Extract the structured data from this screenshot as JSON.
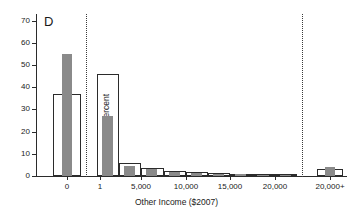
{
  "chart_data": {
    "type": "bar",
    "title": "",
    "panel_label": "D",
    "xlabel": "Other Income ($2007)",
    "ylabel": "Percent",
    "ylim": [
      0,
      73
    ],
    "yticks": [
      0,
      10,
      20,
      30,
      40,
      50,
      60,
      70
    ],
    "ytick_labels": [
      "0",
      "10",
      "20",
      "30",
      "40",
      "50",
      "60",
      "70"
    ],
    "xtick_labels": [
      "0",
      "1",
      "5,000",
      "10,000",
      "15,000",
      "20,000",
      "20,000+"
    ],
    "grid": false,
    "legend": "none",
    "series": [
      {
        "name": "open-outline",
        "style": "open",
        "values": [
          37,
          46,
          6,
          3.5,
          2.2,
          1.6,
          1.2,
          0.9,
          0.7,
          0.5,
          3
        ]
      },
      {
        "name": "gray-filled",
        "style": "filled",
        "values": [
          55,
          27,
          4.4,
          3.2,
          2.0,
          1.4,
          1.0,
          0.8,
          0.6,
          0.4,
          4
        ]
      }
    ],
    "bars": [
      {
        "group": "zero",
        "x_label": "0",
        "open": 37,
        "filled": 55
      },
      {
        "group": "middle",
        "x_label": "1-2500",
        "open": 46,
        "filled": 27
      },
      {
        "group": "middle",
        "x_label": "2500-5000",
        "open": 6,
        "filled": 4.4
      },
      {
        "group": "middle",
        "x_label": "5000-7500",
        "open": 3.5,
        "filled": 3.2
      },
      {
        "group": "middle",
        "x_label": "7500-10000",
        "open": 2.2,
        "filled": 2.0
      },
      {
        "group": "middle",
        "x_label": "10000-12500",
        "open": 1.6,
        "filled": 1.4
      },
      {
        "group": "middle",
        "x_label": "12500-15000",
        "open": 1.2,
        "filled": 1.0
      },
      {
        "group": "middle",
        "x_label": "15000-17500",
        "open": 0.9,
        "filled": 0.8
      },
      {
        "group": "middle",
        "x_label": "17500-20000",
        "open": 0.7,
        "filled": 0.6
      },
      {
        "group": "middle",
        "x_label": "20000",
        "open": 0.5,
        "filled": 0.4
      },
      {
        "group": "top",
        "x_label": "20,000+",
        "open": 3,
        "filled": 4
      }
    ],
    "separators": [
      "after-zero-category",
      "before-topcode-category"
    ],
    "colors": {
      "fill": "#8a8a8a",
      "outline": "#2b2b2b",
      "axis": "#2b2b2b",
      "separator": "#3a3a3a",
      "background": "#ffffff"
    }
  }
}
